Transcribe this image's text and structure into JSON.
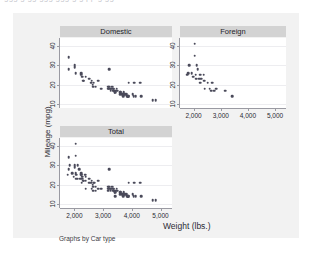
{
  "top_fragment": "ggg g gg ggg ggg g g pp g gg",
  "graph": {
    "y_axis_title": "Mileage (mpg)",
    "x_axis_title": "Weight (lbs.)",
    "footer_note": "Graphs by Car type",
    "panel_titles": [
      "Domestic",
      "Foreign",
      "Total"
    ],
    "colors": {
      "card_background": "#f2f2f2",
      "panel_background": "#ffffff",
      "title_bar": "#d3d3d3",
      "marker": "#4a4a5a",
      "axis": "#9a9aa2",
      "gridline": "#ededf0",
      "text": "#2b2b33"
    }
  },
  "chart_data": {
    "type": "scatter",
    "title": "",
    "xlabel": "Weight (lbs.)",
    "ylabel": "Mileage (mpg)",
    "xlim": [
      1500,
      5400
    ],
    "ylim": [
      8,
      44
    ],
    "xticks": [
      2000,
      3000,
      4000,
      5000
    ],
    "xtick_labels": [
      "2,000",
      "3,000",
      "4,000",
      "5,000"
    ],
    "yticks": [
      10,
      20,
      30,
      40
    ],
    "ytick_labels": [
      "10",
      "20",
      "30",
      "40"
    ],
    "grid": true,
    "legend": "none",
    "by_variable": "Car type",
    "panels": [
      {
        "name": "Domestic",
        "position": "top-left",
        "points": [
          [
            1800,
            28
          ],
          [
            1800,
            34
          ],
          [
            2020,
            30
          ],
          [
            2020,
            29
          ],
          [
            2040,
            26
          ],
          [
            2230,
            26
          ],
          [
            2230,
            25
          ],
          [
            2280,
            24
          ],
          [
            2300,
            22
          ],
          [
            2330,
            22
          ],
          [
            2400,
            24
          ],
          [
            2520,
            23
          ],
          [
            2580,
            21
          ],
          [
            2600,
            22
          ],
          [
            2640,
            20
          ],
          [
            2650,
            19
          ],
          [
            2670,
            21
          ],
          [
            2750,
            19
          ],
          [
            2830,
            22
          ],
          [
            2930,
            18
          ],
          [
            3170,
            19
          ],
          [
            3180,
            18
          ],
          [
            3200,
            18
          ],
          [
            3210,
            28
          ],
          [
            3220,
            19
          ],
          [
            3250,
            18
          ],
          [
            3260,
            17
          ],
          [
            3280,
            18
          ],
          [
            3300,
            19
          ],
          [
            3330,
            19
          ],
          [
            3350,
            18
          ],
          [
            3360,
            17
          ],
          [
            3370,
            18
          ],
          [
            3380,
            17
          ],
          [
            3400,
            16
          ],
          [
            3420,
            17
          ],
          [
            3430,
            16
          ],
          [
            3470,
            18
          ],
          [
            3500,
            17
          ],
          [
            3600,
            16
          ],
          [
            3600,
            15
          ],
          [
            3620,
            16
          ],
          [
            3670,
            15
          ],
          [
            3690,
            15
          ],
          [
            3700,
            14
          ],
          [
            3720,
            16
          ],
          [
            3740,
            15
          ],
          [
            3770,
            15
          ],
          [
            3830,
            15
          ],
          [
            3840,
            14
          ],
          [
            3850,
            14
          ],
          [
            3880,
            14
          ],
          [
            3900,
            14
          ],
          [
            3900,
            21
          ],
          [
            4030,
            15
          ],
          [
            4060,
            14
          ],
          [
            4080,
            21
          ],
          [
            4130,
            14
          ],
          [
            4290,
            21
          ],
          [
            4330,
            14
          ],
          [
            4720,
            12
          ],
          [
            4840,
            12
          ]
        ]
      },
      {
        "name": "Foreign",
        "position": "top-right",
        "points": [
          [
            1760,
            25
          ],
          [
            1800,
            26
          ],
          [
            1830,
            30
          ],
          [
            1930,
            26
          ],
          [
            1980,
            24
          ],
          [
            2040,
            35
          ],
          [
            2050,
            41
          ],
          [
            2070,
            23
          ],
          [
            2070,
            25
          ],
          [
            2110,
            23
          ],
          [
            2120,
            30
          ],
          [
            2160,
            28
          ],
          [
            2200,
            23
          ],
          [
            2240,
            25
          ],
          [
            2250,
            21
          ],
          [
            2280,
            23
          ],
          [
            2370,
            25
          ],
          [
            2390,
            22
          ],
          [
            2400,
            18
          ],
          [
            2520,
            21
          ],
          [
            2600,
            18
          ],
          [
            2650,
            17
          ],
          [
            2690,
            21
          ],
          [
            2750,
            17
          ],
          [
            2830,
            18
          ],
          [
            3170,
            17
          ],
          [
            3420,
            14
          ]
        ]
      },
      {
        "name": "Total",
        "position": "bottom-left",
        "points": [
          [
            1760,
            25
          ],
          [
            1800,
            28
          ],
          [
            1800,
            34
          ],
          [
            1830,
            30
          ],
          [
            1930,
            26
          ],
          [
            1980,
            24
          ],
          [
            2020,
            30
          ],
          [
            2020,
            29
          ],
          [
            2040,
            26
          ],
          [
            2040,
            35
          ],
          [
            2050,
            41
          ],
          [
            2070,
            23
          ],
          [
            2070,
            25
          ],
          [
            2110,
            23
          ],
          [
            2120,
            30
          ],
          [
            2160,
            28
          ],
          [
            2200,
            23
          ],
          [
            2230,
            26
          ],
          [
            2230,
            25
          ],
          [
            2240,
            25
          ],
          [
            2250,
            21
          ],
          [
            2280,
            24
          ],
          [
            2280,
            23
          ],
          [
            2300,
            22
          ],
          [
            2330,
            22
          ],
          [
            2370,
            25
          ],
          [
            2390,
            22
          ],
          [
            2400,
            24
          ],
          [
            2400,
            18
          ],
          [
            2520,
            23
          ],
          [
            2520,
            21
          ],
          [
            2580,
            21
          ],
          [
            2600,
            22
          ],
          [
            2600,
            18
          ],
          [
            2640,
            20
          ],
          [
            2650,
            19
          ],
          [
            2650,
            17
          ],
          [
            2670,
            21
          ],
          [
            2690,
            21
          ],
          [
            2750,
            19
          ],
          [
            2750,
            17
          ],
          [
            2830,
            22
          ],
          [
            2830,
            18
          ],
          [
            2930,
            18
          ],
          [
            3170,
            19
          ],
          [
            3170,
            17
          ],
          [
            3180,
            18
          ],
          [
            3200,
            18
          ],
          [
            3210,
            28
          ],
          [
            3220,
            19
          ],
          [
            3250,
            18
          ],
          [
            3260,
            17
          ],
          [
            3280,
            18
          ],
          [
            3300,
            19
          ],
          [
            3330,
            19
          ],
          [
            3350,
            18
          ],
          [
            3360,
            17
          ],
          [
            3370,
            18
          ],
          [
            3380,
            17
          ],
          [
            3400,
            16
          ],
          [
            3420,
            17
          ],
          [
            3420,
            14
          ],
          [
            3430,
            16
          ],
          [
            3470,
            18
          ],
          [
            3500,
            17
          ],
          [
            3600,
            16
          ],
          [
            3600,
            15
          ],
          [
            3620,
            16
          ],
          [
            3670,
            15
          ],
          [
            3690,
            15
          ],
          [
            3700,
            14
          ],
          [
            3720,
            16
          ],
          [
            3740,
            15
          ],
          [
            3770,
            15
          ],
          [
            3830,
            15
          ],
          [
            3840,
            14
          ],
          [
            3850,
            14
          ],
          [
            3880,
            14
          ],
          [
            3900,
            14
          ],
          [
            3900,
            21
          ],
          [
            4030,
            15
          ],
          [
            4060,
            14
          ],
          [
            4080,
            21
          ],
          [
            4130,
            14
          ],
          [
            4290,
            21
          ],
          [
            4330,
            14
          ],
          [
            4720,
            12
          ],
          [
            4840,
            12
          ]
        ]
      }
    ]
  }
}
